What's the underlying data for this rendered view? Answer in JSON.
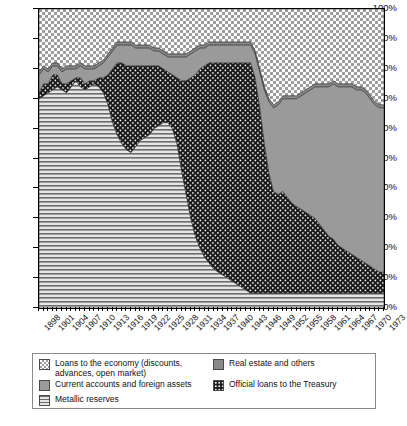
{
  "chart_data": {
    "type": "area",
    "stacked": true,
    "percent": true,
    "title": "",
    "xlabel": "",
    "ylabel": "",
    "ylim": [
      0,
      100
    ],
    "grid": false,
    "legend_position": "bottom",
    "tick_labels": {
      "y": [
        "0%",
        "10%",
        "20%",
        "30%",
        "40%",
        "50%",
        "60%",
        "70%",
        "80%",
        "90%",
        "100%"
      ],
      "x": [
        "1898",
        "1901",
        "1904",
        "1907",
        "1910",
        "1913",
        "1916",
        "1919",
        "1922",
        "1925",
        "1928",
        "1931",
        "1934",
        "1937",
        "1940",
        "1943",
        "1946",
        "1949",
        "1952",
        "1955",
        "1958",
        "1961",
        "1964",
        "1967",
        "1970",
        "1973"
      ]
    },
    "x": [
      1898,
      1899,
      1900,
      1901,
      1902,
      1903,
      1904,
      1905,
      1906,
      1907,
      1908,
      1909,
      1910,
      1911,
      1912,
      1913,
      1914,
      1915,
      1916,
      1917,
      1918,
      1919,
      1920,
      1921,
      1922,
      1923,
      1924,
      1925,
      1926,
      1927,
      1928,
      1929,
      1930,
      1931,
      1932,
      1933,
      1934,
      1935,
      1936,
      1937,
      1938,
      1939,
      1940,
      1941,
      1942,
      1943,
      1944,
      1945,
      1946,
      1947,
      1948,
      1949,
      1950,
      1951,
      1952,
      1953,
      1954,
      1955,
      1956,
      1957,
      1958,
      1959,
      1960,
      1961,
      1962,
      1963,
      1964,
      1965,
      1966,
      1967,
      1968,
      1969,
      1970,
      1971,
      1972,
      1973
    ],
    "series": [
      {
        "name": "Metallic reserves",
        "pattern": "horizontal-lines",
        "color": "#d8d8d8",
        "values": [
          70,
          71,
          72,
          73,
          74,
          73,
          72,
          74,
          76,
          74,
          73,
          74,
          75,
          74,
          72,
          68,
          62,
          58,
          55,
          53,
          52,
          54,
          56,
          57,
          58,
          60,
          61,
          62,
          62,
          60,
          55,
          46,
          38,
          30,
          24,
          20,
          17,
          15,
          13,
          12,
          11,
          10,
          9,
          8,
          7,
          6,
          5,
          5,
          5,
          5,
          5,
          5,
          5,
          5,
          5,
          5,
          5,
          5,
          5,
          5,
          5,
          5,
          5,
          5,
          5,
          5,
          5,
          5,
          5,
          5,
          5,
          5,
          5,
          5,
          5,
          5
        ]
      },
      {
        "name": "Official loans to the Treasury",
        "pattern": "dark-dotted",
        "color": "#1b1b1b",
        "values": [
          2,
          4,
          3,
          5,
          4,
          2,
          3,
          2,
          1,
          3,
          2,
          2,
          1,
          3,
          5,
          10,
          18,
          24,
          27,
          28,
          29,
          27,
          25,
          24,
          23,
          21,
          20,
          18,
          17,
          18,
          22,
          30,
          38,
          47,
          54,
          60,
          64,
          67,
          69,
          70,
          71,
          72,
          73,
          74,
          75,
          76,
          77,
          72,
          62,
          50,
          40,
          34,
          33,
          34,
          32,
          30,
          29,
          28,
          27,
          26,
          25,
          23,
          21,
          19,
          18,
          16,
          15,
          14,
          13,
          12,
          11,
          10,
          9,
          8,
          7,
          7
        ]
      },
      {
        "name": "Current accounts and foreign assets",
        "pattern": "solid-gray",
        "color": "#9a9a9a",
        "values": [
          6,
          5,
          4,
          3,
          3,
          4,
          5,
          4,
          3,
          4,
          5,
          4,
          4,
          4,
          5,
          6,
          6,
          6,
          6,
          7,
          7,
          6,
          6,
          6,
          6,
          5,
          5,
          5,
          5,
          6,
          7,
          8,
          8,
          8,
          8,
          7,
          6,
          6,
          6,
          6,
          6,
          6,
          6,
          6,
          6,
          6,
          6,
          8,
          12,
          18,
          24,
          28,
          30,
          31,
          33,
          35,
          36,
          38,
          40,
          42,
          44,
          46,
          48,
          50,
          52,
          53,
          54,
          55,
          56,
          56,
          57,
          57,
          56,
          55,
          55,
          55
        ]
      },
      {
        "name": "Real estate and others",
        "pattern": "mid-gray",
        "color": "#8d8d8d",
        "values": [
          1,
          1,
          1,
          1,
          1,
          1,
          1,
          1,
          1,
          1,
          1,
          1,
          1,
          1,
          1,
          1,
          1,
          1,
          1,
          1,
          1,
          1,
          1,
          1,
          1,
          1,
          1,
          1,
          1,
          1,
          1,
          1,
          1,
          1,
          1,
          1,
          1,
          1,
          1,
          1,
          1,
          1,
          1,
          1,
          1,
          1,
          1,
          1,
          1,
          1,
          1,
          1,
          1,
          1,
          1,
          1,
          1,
          1,
          1,
          1,
          1,
          1,
          1,
          1,
          1,
          1,
          1,
          1,
          1,
          1,
          1,
          1,
          1,
          1,
          1,
          1
        ]
      },
      {
        "name": "Loans to the economy (discounts, advances, open market)",
        "pattern": "checkerboard",
        "color": "#e8e8e8",
        "values": [
          21,
          19,
          20,
          18,
          18,
          20,
          19,
          19,
          19,
          18,
          19,
          19,
          19,
          18,
          17,
          15,
          13,
          11,
          11,
          11,
          11,
          12,
          12,
          12,
          12,
          13,
          13,
          14,
          15,
          15,
          15,
          15,
          15,
          14,
          13,
          12,
          12,
          11,
          11,
          11,
          11,
          11,
          11,
          11,
          11,
          11,
          11,
          14,
          20,
          26,
          30,
          32,
          31,
          29,
          29,
          29,
          29,
          28,
          27,
          26,
          25,
          25,
          25,
          25,
          24,
          25,
          25,
          25,
          25,
          26,
          26,
          27,
          29,
          31,
          32,
          32
        ]
      }
    ]
  },
  "legend": {
    "items": [
      {
        "label": "Loans to the economy (discounts, advances, open market)",
        "swatch": "checkerboard-swatch"
      },
      {
        "label": "Real estate and others",
        "swatch": "mid-gray-swatch"
      },
      {
        "label": "Current accounts and foreign assets",
        "swatch": "solid-gray-swatch"
      },
      {
        "label": "Official loans to the Treasury",
        "swatch": "dark-dotted-swatch"
      },
      {
        "label": "Metallic reserves",
        "swatch": "horizontal-lines-swatch"
      }
    ]
  },
  "caption": {
    "text": ""
  }
}
